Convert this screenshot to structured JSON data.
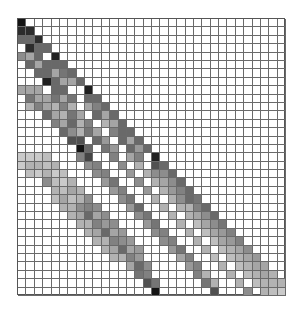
{
  "chart_data": {
    "type": "heatmap",
    "title": "",
    "xlabel": "",
    "ylabel": "",
    "colormap": "grayscale (white = 0, black = max)",
    "grid": true,
    "cols": 32,
    "rows": 33,
    "structure": "lower-triangular matrix with strong main diagonal and several parallel sub-diagonal bands",
    "cells": [
      [
        0,
        0,
        0.95
      ],
      [
        1,
        0,
        0.85
      ],
      [
        1,
        1,
        0.85
      ],
      [
        2,
        0,
        0.6
      ],
      [
        2,
        1,
        0.6
      ],
      [
        2,
        2,
        0.85
      ],
      [
        3,
        1,
        0.85
      ],
      [
        3,
        2,
        0.6
      ],
      [
        3,
        3,
        0.6
      ],
      [
        4,
        0,
        0.45
      ],
      [
        4,
        1,
        0.35
      ],
      [
        4,
        2,
        0.6
      ],
      [
        4,
        4,
        0.9
      ],
      [
        5,
        1,
        0.6
      ],
      [
        5,
        2,
        0.35
      ],
      [
        5,
        3,
        0.6
      ],
      [
        5,
        4,
        0.6
      ],
      [
        5,
        5,
        0.6
      ],
      [
        6,
        2,
        0.6
      ],
      [
        6,
        3,
        0.6
      ],
      [
        6,
        4,
        0.35
      ],
      [
        6,
        5,
        0.55
      ],
      [
        6,
        6,
        0.6
      ],
      [
        7,
        3,
        0.9
      ],
      [
        7,
        4,
        0.6
      ],
      [
        7,
        5,
        0.35
      ],
      [
        7,
        6,
        0.35
      ],
      [
        7,
        7,
        0.6
      ],
      [
        8,
        0,
        0.35
      ],
      [
        8,
        1,
        0.35
      ],
      [
        8,
        2,
        0.35
      ],
      [
        8,
        4,
        0.6
      ],
      [
        8,
        5,
        0.6
      ],
      [
        8,
        8,
        0.9
      ],
      [
        9,
        1,
        0.55
      ],
      [
        9,
        2,
        0.35
      ],
      [
        9,
        3,
        0.35
      ],
      [
        9,
        4,
        0.55
      ],
      [
        9,
        5,
        0.35
      ],
      [
        9,
        6,
        0.55
      ],
      [
        9,
        8,
        0.6
      ],
      [
        9,
        9,
        0.6
      ],
      [
        10,
        1,
        0.3
      ],
      [
        10,
        2,
        0.5
      ],
      [
        10,
        3,
        0.35
      ],
      [
        10,
        4,
        0.3
      ],
      [
        10,
        5,
        0.5
      ],
      [
        10,
        6,
        0.3
      ],
      [
        10,
        8,
        0.35
      ],
      [
        10,
        9,
        0.5
      ],
      [
        10,
        10,
        0.6
      ],
      [
        11,
        3,
        0.6
      ],
      [
        11,
        4,
        0.35
      ],
      [
        11,
        5,
        0.3
      ],
      [
        11,
        6,
        0.55
      ],
      [
        11,
        7,
        0.35
      ],
      [
        11,
        9,
        0.6
      ],
      [
        11,
        10,
        0.35
      ],
      [
        11,
        11,
        0.6
      ],
      [
        12,
        4,
        0.5
      ],
      [
        12,
        5,
        0.35
      ],
      [
        12,
        6,
        0.6
      ],
      [
        12,
        7,
        0.3
      ],
      [
        12,
        8,
        0.5
      ],
      [
        12,
        10,
        0.3
      ],
      [
        12,
        11,
        0.35
      ],
      [
        12,
        12,
        0.6
      ],
      [
        13,
        5,
        0.6
      ],
      [
        13,
        6,
        0.45
      ],
      [
        13,
        7,
        0.3
      ],
      [
        13,
        8,
        0.55
      ],
      [
        13,
        9,
        0.35
      ],
      [
        13,
        11,
        0.5
      ],
      [
        13,
        12,
        0.6
      ],
      [
        13,
        13,
        0.6
      ],
      [
        14,
        6,
        0.7
      ],
      [
        14,
        7,
        0.7
      ],
      [
        14,
        9,
        0.6
      ],
      [
        14,
        10,
        0.4
      ],
      [
        14,
        12,
        0.6
      ],
      [
        14,
        13,
        0.35
      ],
      [
        14,
        14,
        0.6
      ],
      [
        15,
        7,
        0.95
      ],
      [
        15,
        8,
        0.6
      ],
      [
        15,
        10,
        0.55
      ],
      [
        15,
        11,
        0.4
      ],
      [
        15,
        13,
        0.6
      ],
      [
        15,
        14,
        0.4
      ],
      [
        15,
        15,
        0.6
      ],
      [
        16,
        0,
        0.2
      ],
      [
        16,
        1,
        0.2
      ],
      [
        16,
        2,
        0.2
      ],
      [
        16,
        3,
        0.25
      ],
      [
        16,
        7,
        0.5
      ],
      [
        16,
        8,
        0.75
      ],
      [
        16,
        11,
        0.5
      ],
      [
        16,
        13,
        0.35
      ],
      [
        16,
        14,
        0.5
      ],
      [
        16,
        16,
        0.9
      ],
      [
        17,
        0,
        0.2
      ],
      [
        17,
        1,
        0.3
      ],
      [
        17,
        2,
        0.3
      ],
      [
        17,
        3,
        0.25
      ],
      [
        17,
        4,
        0.3
      ],
      [
        17,
        8,
        0.45
      ],
      [
        17,
        9,
        0.5
      ],
      [
        17,
        12,
        0.45
      ],
      [
        17,
        14,
        0.3
      ],
      [
        17,
        16,
        0.7
      ],
      [
        17,
        17,
        0.6
      ],
      [
        18,
        1,
        0.25
      ],
      [
        18,
        2,
        0.2
      ],
      [
        18,
        3,
        0.3
      ],
      [
        18,
        4,
        0.2
      ],
      [
        18,
        5,
        0.25
      ],
      [
        18,
        9,
        0.45
      ],
      [
        18,
        10,
        0.5
      ],
      [
        18,
        13,
        0.4
      ],
      [
        18,
        15,
        0.3
      ],
      [
        18,
        16,
        0.45
      ],
      [
        18,
        17,
        0.45
      ],
      [
        18,
        18,
        0.6
      ],
      [
        19,
        3,
        0.45
      ],
      [
        19,
        4,
        0.25
      ],
      [
        19,
        5,
        0.2
      ],
      [
        19,
        6,
        0.3
      ],
      [
        19,
        10,
        0.4
      ],
      [
        19,
        11,
        0.55
      ],
      [
        19,
        14,
        0.45
      ],
      [
        19,
        16,
        0.3
      ],
      [
        19,
        17,
        0.35
      ],
      [
        19,
        18,
        0.45
      ],
      [
        19,
        19,
        0.6
      ],
      [
        20,
        4,
        0.3
      ],
      [
        20,
        5,
        0.25
      ],
      [
        20,
        6,
        0.35
      ],
      [
        20,
        7,
        0.3
      ],
      [
        20,
        11,
        0.4
      ],
      [
        20,
        12,
        0.5
      ],
      [
        20,
        15,
        0.4
      ],
      [
        20,
        17,
        0.3
      ],
      [
        20,
        18,
        0.4
      ],
      [
        20,
        19,
        0.5
      ],
      [
        20,
        20,
        0.6
      ],
      [
        21,
        4,
        0.25
      ],
      [
        21,
        5,
        0.35
      ],
      [
        21,
        6,
        0.25
      ],
      [
        21,
        7,
        0.3
      ],
      [
        21,
        8,
        0.45
      ],
      [
        21,
        12,
        0.45
      ],
      [
        21,
        13,
        0.55
      ],
      [
        21,
        16,
        0.3
      ],
      [
        21,
        18,
        0.3
      ],
      [
        21,
        19,
        0.45
      ],
      [
        21,
        20,
        0.6
      ],
      [
        21,
        21,
        0.55
      ],
      [
        22,
        5,
        0.3
      ],
      [
        22,
        6,
        0.3
      ],
      [
        22,
        7,
        0.45
      ],
      [
        22,
        8,
        0.5
      ],
      [
        22,
        9,
        0.45
      ],
      [
        22,
        13,
        0.4
      ],
      [
        22,
        14,
        0.6
      ],
      [
        22,
        17,
        0.3
      ],
      [
        22,
        19,
        0.3
      ],
      [
        22,
        20,
        0.3
      ],
      [
        22,
        21,
        0.5
      ],
      [
        22,
        22,
        0.6
      ],
      [
        23,
        6,
        0.3
      ],
      [
        23,
        7,
        0.35
      ],
      [
        23,
        8,
        0.6
      ],
      [
        23,
        9,
        0.35
      ],
      [
        23,
        10,
        0.45
      ],
      [
        23,
        14,
        0.45
      ],
      [
        23,
        15,
        0.55
      ],
      [
        23,
        18,
        0.3
      ],
      [
        23,
        20,
        0.3
      ],
      [
        23,
        21,
        0.35
      ],
      [
        23,
        22,
        0.45
      ],
      [
        23,
        23,
        0.6
      ],
      [
        24,
        7,
        0.3
      ],
      [
        24,
        8,
        0.3
      ],
      [
        24,
        9,
        0.5
      ],
      [
        24,
        10,
        0.4
      ],
      [
        24,
        11,
        0.45
      ],
      [
        24,
        15,
        0.4
      ],
      [
        24,
        16,
        0.55
      ],
      [
        24,
        19,
        0.3
      ],
      [
        24,
        21,
        0.25
      ],
      [
        24,
        22,
        0.35
      ],
      [
        24,
        23,
        0.45
      ],
      [
        24,
        24,
        0.55
      ],
      [
        25,
        8,
        0.3
      ],
      [
        25,
        9,
        0.35
      ],
      [
        25,
        10,
        0.6
      ],
      [
        25,
        11,
        0.35
      ],
      [
        25,
        12,
        0.4
      ],
      [
        25,
        16,
        0.45
      ],
      [
        25,
        17,
        0.5
      ],
      [
        25,
        20,
        0.3
      ],
      [
        25,
        22,
        0.25
      ],
      [
        25,
        23,
        0.35
      ],
      [
        25,
        24,
        0.4
      ],
      [
        25,
        25,
        0.5
      ],
      [
        26,
        9,
        0.3
      ],
      [
        26,
        10,
        0.3
      ],
      [
        26,
        11,
        0.5
      ],
      [
        26,
        12,
        0.45
      ],
      [
        26,
        13,
        0.4
      ],
      [
        26,
        17,
        0.45
      ],
      [
        26,
        18,
        0.5
      ],
      [
        26,
        21,
        0.3
      ],
      [
        26,
        23,
        0.25
      ],
      [
        26,
        24,
        0.35
      ],
      [
        26,
        25,
        0.4
      ],
      [
        26,
        26,
        0.5
      ],
      [
        27,
        10,
        0.3
      ],
      [
        27,
        11,
        0.35
      ],
      [
        27,
        12,
        0.6
      ],
      [
        27,
        13,
        0.35
      ],
      [
        27,
        14,
        0.4
      ],
      [
        27,
        18,
        0.4
      ],
      [
        27,
        19,
        0.55
      ],
      [
        27,
        22,
        0.3
      ],
      [
        27,
        24,
        0.25
      ],
      [
        27,
        25,
        0.3
      ],
      [
        27,
        26,
        0.35
      ],
      [
        27,
        27,
        0.45
      ],
      [
        28,
        11,
        0.3
      ],
      [
        28,
        12,
        0.3
      ],
      [
        28,
        13,
        0.5
      ],
      [
        28,
        14,
        0.4
      ],
      [
        28,
        19,
        0.35
      ],
      [
        28,
        20,
        0.5
      ],
      [
        28,
        23,
        0.25
      ],
      [
        28,
        25,
        0.25
      ],
      [
        28,
        26,
        0.3
      ],
      [
        28,
        27,
        0.35
      ],
      [
        28,
        28,
        0.4
      ],
      [
        29,
        13,
        0.35
      ],
      [
        29,
        14,
        0.6
      ],
      [
        29,
        15,
        0.45
      ],
      [
        29,
        20,
        0.4
      ],
      [
        29,
        21,
        0.5
      ],
      [
        29,
        24,
        0.3
      ],
      [
        29,
        26,
        0.25
      ],
      [
        29,
        27,
        0.3
      ],
      [
        29,
        28,
        0.35
      ],
      [
        29,
        29,
        0.35
      ],
      [
        30,
        14,
        0.55
      ],
      [
        30,
        15,
        0.5
      ],
      [
        30,
        21,
        0.5
      ],
      [
        30,
        22,
        0.3
      ],
      [
        30,
        25,
        0.3
      ],
      [
        30,
        27,
        0.25
      ],
      [
        30,
        28,
        0.3
      ],
      [
        30,
        29,
        0.35
      ],
      [
        30,
        30,
        0.3
      ],
      [
        31,
        15,
        0.7
      ],
      [
        31,
        16,
        0.55
      ],
      [
        31,
        22,
        0.55
      ],
      [
        31,
        23,
        0.3
      ],
      [
        31,
        26,
        0.3
      ],
      [
        31,
        28,
        0.25
      ],
      [
        31,
        29,
        0.3
      ],
      [
        31,
        30,
        0.3
      ],
      [
        31,
        31,
        0.3
      ],
      [
        32,
        16,
        0.95
      ],
      [
        32,
        23,
        0.7
      ],
      [
        32,
        27,
        0.45
      ],
      [
        32,
        29,
        0.3
      ],
      [
        32,
        30,
        0.25
      ],
      [
        32,
        31,
        0.2
      ]
    ]
  }
}
